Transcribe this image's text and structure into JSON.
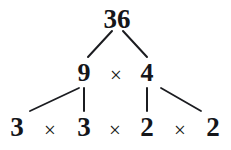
{
  "figure": {
    "background_color": "#ffffff",
    "text_color": "#15161a",
    "line_color": "#1b1c20"
  },
  "tree": {
    "root": {
      "label": "36",
      "x": 117,
      "y": 6
    },
    "level2": {
      "left": {
        "label": "9",
        "x": 84,
        "y": 60
      },
      "operator": {
        "label": "×",
        "x": 116,
        "y": 65
      },
      "right": {
        "label": "4",
        "x": 147,
        "y": 60
      }
    },
    "level3": {
      "factors": [
        {
          "label": "3",
          "x": 17,
          "y": 114
        },
        {
          "label": "3",
          "x": 84,
          "y": 114
        },
        {
          "label": "2",
          "x": 147,
          "y": 114
        },
        {
          "label": "2",
          "x": 213,
          "y": 114
        }
      ],
      "operators": [
        {
          "label": "×",
          "x": 50,
          "y": 120
        },
        {
          "label": "×",
          "x": 115,
          "y": 120
        },
        {
          "label": "×",
          "x": 180,
          "y": 120
        }
      ]
    },
    "edges": [
      {
        "name": "edge-36-to-9",
        "x1": 112,
        "y1": 31,
        "x2": 88,
        "y2": 57,
        "width": 2.0
      },
      {
        "name": "edge-36-to-4",
        "x1": 123,
        "y1": 31,
        "x2": 147,
        "y2": 57,
        "width": 2.0
      },
      {
        "name": "edge-9-to-3a",
        "x1": 79,
        "y1": 88,
        "x2": 30,
        "y2": 111,
        "width": 1.8
      },
      {
        "name": "edge-9-to-3b",
        "x1": 84,
        "y1": 88,
        "x2": 84,
        "y2": 111,
        "width": 2.0
      },
      {
        "name": "edge-4-to-2a",
        "x1": 147,
        "y1": 88,
        "x2": 147,
        "y2": 111,
        "width": 2.0
      },
      {
        "name": "edge-4-to-2b",
        "x1": 161,
        "y1": 88,
        "x2": 201,
        "y2": 111,
        "width": 1.8
      }
    ]
  },
  "chart_data": {
    "type": "diagram",
    "diagram_kind": "factor-tree",
    "number": 36,
    "levels": [
      [
        "36"
      ],
      [
        "9",
        "×",
        "4"
      ],
      [
        "3",
        "×",
        "3",
        "×",
        "2",
        "×",
        "2"
      ]
    ],
    "factorization": "3 × 3 × 2 × 2",
    "prime_factors": [
      3,
      3,
      2,
      2
    ],
    "connections": [
      {
        "from": "36",
        "to": "9"
      },
      {
        "from": "36",
        "to": "4"
      },
      {
        "from": "9",
        "to": "3"
      },
      {
        "from": "9",
        "to": "3"
      },
      {
        "from": "4",
        "to": "2"
      },
      {
        "from": "4",
        "to": "2"
      }
    ]
  }
}
